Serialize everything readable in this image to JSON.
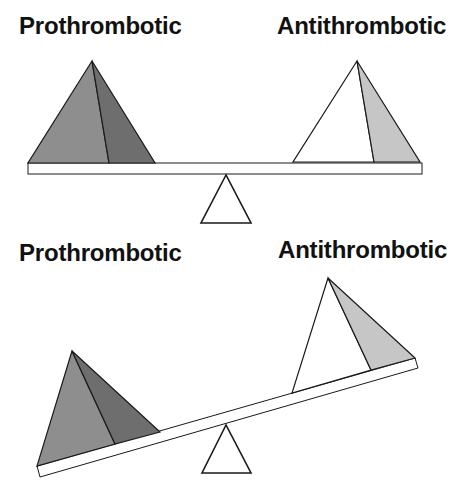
{
  "colors": {
    "background": "#ffffff",
    "outline": "#1a1a1a",
    "prothrombotic_front_face": "#8e8e8e",
    "prothrombotic_side_face": "#6e6e6e",
    "antithrombotic_front_face": "#ffffff",
    "antithrombotic_side_face": "#c6c6c6",
    "beam_fill": "#ffffff",
    "fulcrum_fill": "#ffffff"
  },
  "panels": [
    {
      "state": "balanced",
      "left_label": "Prothrombotic",
      "right_label": "Antithrombotic"
    },
    {
      "state": "tipped-toward-prothrombotic",
      "left_label": "Prothrombotic",
      "right_label": "Antithrombotic"
    }
  ]
}
